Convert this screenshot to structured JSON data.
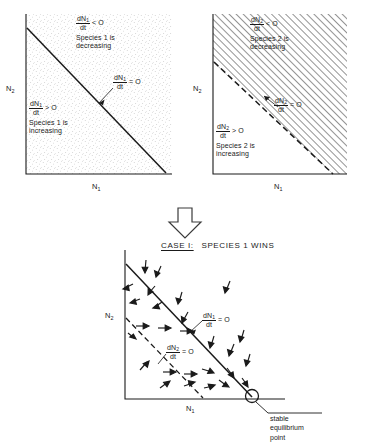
{
  "figure": {
    "type": "lotka-volterra-competition-isocline-diagram",
    "panels": [
      {
        "id": "panel-1",
        "shading": "stipple",
        "isocline_style": "solid",
        "axis_x_label": "N",
        "axis_x_sub": "1",
        "axis_y_label": "N",
        "axis_y_sub": "2",
        "upper_region": {
          "num": "dN",
          "num_sub": "1",
          "den": "dt",
          "relation": "< O",
          "line1": "Species 1 is",
          "line2": "decreasing"
        },
        "lower_region": {
          "num": "dN",
          "num_sub": "1",
          "den": "dt",
          "relation": "> O",
          "line1": "Species 1 is",
          "line2": "increasing"
        },
        "isocline_label": {
          "num": "dN",
          "num_sub": "1",
          "den": "dt",
          "relation": "= O"
        }
      },
      {
        "id": "panel-2",
        "shading": "hatch",
        "isocline_style": "dashed",
        "axis_x_label": "N",
        "axis_x_sub": "1",
        "axis_y_label": "N",
        "axis_y_sub": "2",
        "upper_region": {
          "num": "dN",
          "num_sub": "2",
          "den": "dt",
          "relation": "< O",
          "line1": "Species 2 is",
          "line2": "decreasing"
        },
        "lower_region": {
          "num": "dN",
          "num_sub": "2",
          "den": "dt",
          "relation": "> O",
          "line1": "Species 2 is",
          "line2": "increasing"
        },
        "isocline_label": {
          "num": "dN",
          "num_sub": "2",
          "den": "dt",
          "relation": "= O"
        }
      }
    ],
    "transition_arrow": "down-arrow",
    "result_panel": {
      "id": "panel-3",
      "title_case": "CASE I:",
      "title_text": "SPECIES 1 WINS",
      "axis_x_label": "N",
      "axis_x_sub": "1",
      "axis_y_label": "N",
      "axis_y_sub": "2",
      "isocline_1_label": {
        "num": "dN",
        "num_sub": "1",
        "den": "dt",
        "relation": "= O"
      },
      "isocline_2_label": {
        "num": "dN",
        "num_sub": "2",
        "den": "dt",
        "relation": "= O"
      },
      "equilibrium_note_line1": "stable",
      "equilibrium_note_line2": "equilibrium",
      "equilibrium_note_line3": "point",
      "marker": "circle"
    },
    "colors": {
      "ink": "#1a1a1a",
      "background": "#ffffff",
      "hatch": "#2a2a2a",
      "stipple": "#8a8a8a"
    }
  }
}
